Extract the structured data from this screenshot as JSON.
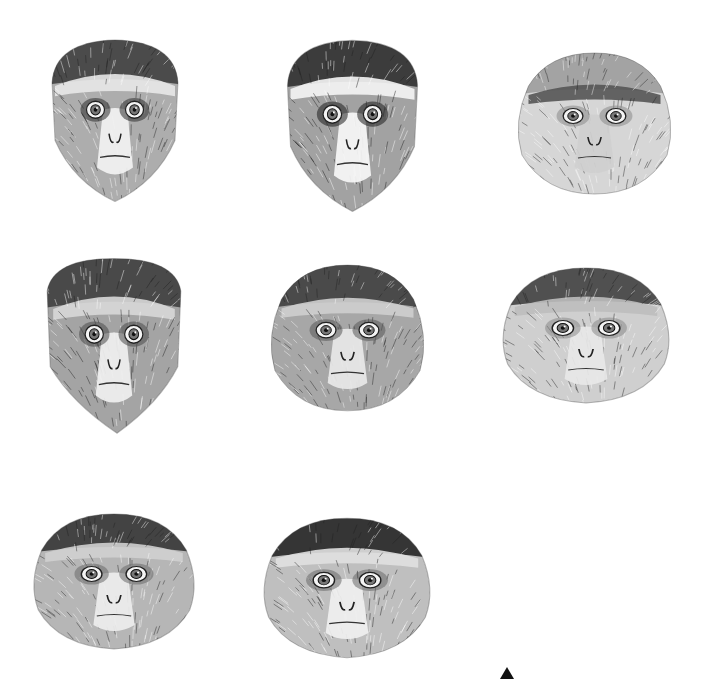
{
  "plate": {
    "background": "#ffffff",
    "layout": "3-column grid of pencil-sketch monkey head illustrations",
    "heads": [
      {
        "id": 1,
        "row": 1,
        "col": 1,
        "x": 40,
        "y": 35,
        "w": 150,
        "h": 170,
        "shape": "tapered",
        "cap_tone": "#3a3a3a",
        "brow_band": "#e8e8e8",
        "face_tone": "#6a6a6a",
        "eye_patch": "#2e2e2e",
        "muzzle": "#f2f2f2",
        "chin": "beard"
      },
      {
        "id": 2,
        "row": 1,
        "col": 2,
        "x": 275,
        "y": 35,
        "w": 155,
        "h": 180,
        "shape": "tapered",
        "cap_tone": "#2a2a2a",
        "brow_band": "#f5f5f5",
        "face_tone": "#555555",
        "eye_patch": "#1e1e1e",
        "muzzle": "#f7f7f7",
        "chin": "white-beard"
      },
      {
        "id": 3,
        "row": 1,
        "col": 3,
        "x": 512,
        "y": 50,
        "w": 165,
        "h": 150,
        "shape": "round",
        "cap_tone": "#9a9a9a",
        "brow_band": "#555555",
        "face_tone": "#b5b5b5",
        "eye_patch": "#8a8a8a",
        "muzzle": "#cfcfcf",
        "chin": "none"
      },
      {
        "id": 4,
        "row": 2,
        "col": 1,
        "x": 38,
        "y": 255,
        "w": 152,
        "h": 180,
        "shape": "pointed",
        "cap_tone": "#3a3a3a",
        "brow_band": "#d8d8d8",
        "face_tone": "#5a5a5a",
        "eye_patch": "#4a4a4a",
        "muzzle": "#f0f0f0",
        "chin": "pointed-beard"
      },
      {
        "id": 5,
        "row": 2,
        "col": 2,
        "x": 265,
        "y": 262,
        "w": 165,
        "h": 155,
        "shape": "round",
        "cap_tone": "#3a3a3a",
        "brow_band": "#cfcfcf",
        "face_tone": "#5e5e5e",
        "eye_patch": "#5a5a5a",
        "muzzle": "#e8e8e8",
        "chin": "none"
      },
      {
        "id": 6,
        "row": 2,
        "col": 3,
        "x": 497,
        "y": 262,
        "w": 178,
        "h": 150,
        "shape": "round-wide",
        "cap_tone": "#3a3a3a",
        "brow_band": "#bdbdbd",
        "face_tone": "#a8a8a8",
        "eye_patch": "#8a8a8a",
        "muzzle": "#e8e8e8",
        "chin": "none"
      },
      {
        "id": 7,
        "row": 3,
        "col": 1,
        "x": 28,
        "y": 508,
        "w": 172,
        "h": 150,
        "shape": "round-wide",
        "cap_tone": "#2f2f2f",
        "brow_band": "#d0d0d0",
        "face_tone": "#7a7a7a",
        "eye_patch": "#6a6a6a",
        "muzzle": "#eeeeee",
        "chin": "none"
      },
      {
        "id": 8,
        "row": 3,
        "col": 2,
        "x": 258,
        "y": 512,
        "w": 178,
        "h": 155,
        "shape": "round-wide",
        "cap_tone": "#1c1c1c",
        "brow_band": "#e0e0e0",
        "face_tone": "#8a8a8a",
        "eye_patch": "#6a6a6a",
        "muzzle": "#f0f0f0",
        "chin": "none"
      }
    ],
    "empty_slot": {
      "row": 3,
      "col": 3
    },
    "marker": {
      "shape": "triangle-up",
      "color": "#111111",
      "x": 507,
      "y": 673
    }
  }
}
